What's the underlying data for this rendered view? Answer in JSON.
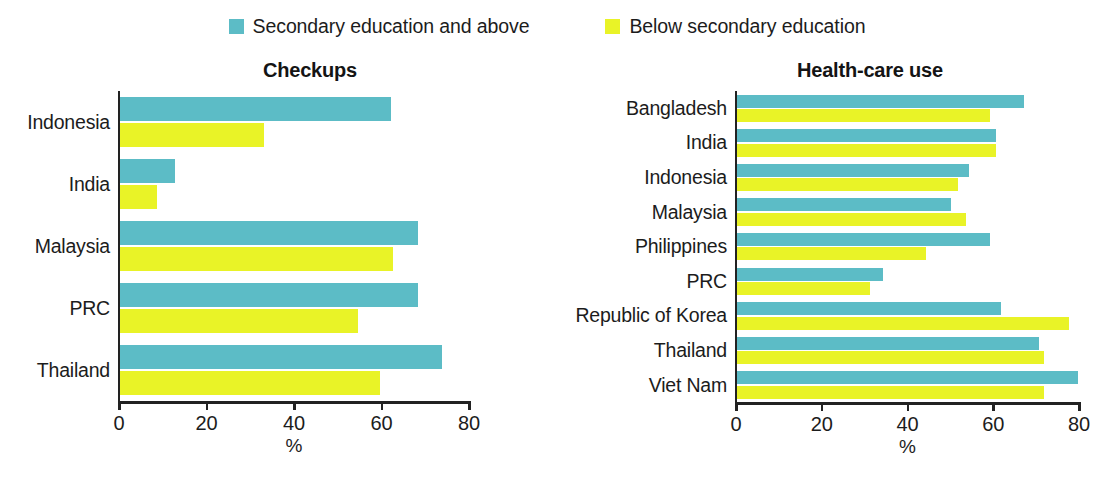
{
  "legend": {
    "items": [
      {
        "label": "Secondary education and above",
        "color": "#5cbcc6",
        "swatch_name": "legend-swatch-secondary-and-above"
      },
      {
        "label": "Below secondary education",
        "color": "#e9f327",
        "swatch_name": "legend-swatch-below-secondary"
      }
    ]
  },
  "axis_unit": "%",
  "chart_data": [
    {
      "type": "bar",
      "orientation": "horizontal",
      "title": "Checkups",
      "xlabel": "%",
      "ylabel": "",
      "xlim": [
        0,
        80
      ],
      "xticks": [
        0,
        20,
        40,
        60,
        80
      ],
      "xticklabels": [
        "0",
        "20",
        "40",
        "60",
        "80"
      ],
      "grid": false,
      "legend_position": "top-center",
      "categories": [
        "Indonesia",
        "India",
        "Malaysia",
        "PRC",
        "Thailand"
      ],
      "series": [
        {
          "name": "Secondary education and above",
          "color": "#5cbcc6",
          "values": [
            62,
            12.5,
            68,
            68,
            73.5
          ]
        },
        {
          "name": "Below secondary education",
          "color": "#e9f327",
          "values": [
            33,
            8.5,
            62.5,
            54.5,
            59.5
          ]
        }
      ]
    },
    {
      "type": "bar",
      "orientation": "horizontal",
      "title": "Health-care use",
      "xlabel": "%",
      "ylabel": "",
      "xlim": [
        0,
        80
      ],
      "xticks": [
        0,
        20,
        40,
        60,
        80
      ],
      "xticklabels": [
        "0",
        "20",
        "40",
        "60",
        "80"
      ],
      "grid": false,
      "legend_position": "top-center",
      "categories": [
        "Bangladesh",
        "India",
        "Indonesia",
        "Malaysia",
        "Philippines",
        "PRC",
        "Republic of Korea",
        "Thailand",
        "Viet Nam"
      ],
      "series": [
        {
          "name": "Secondary education and above",
          "color": "#5cbcc6",
          "values": [
            67,
            60.5,
            54,
            50,
            59,
            34,
            61.5,
            70.5,
            79.5
          ]
        },
        {
          "name": "Below secondary education",
          "color": "#e9f327",
          "values": [
            59,
            60.5,
            51.5,
            53.5,
            44,
            31,
            77.5,
            71.5,
            71.5
          ]
        }
      ]
    }
  ]
}
